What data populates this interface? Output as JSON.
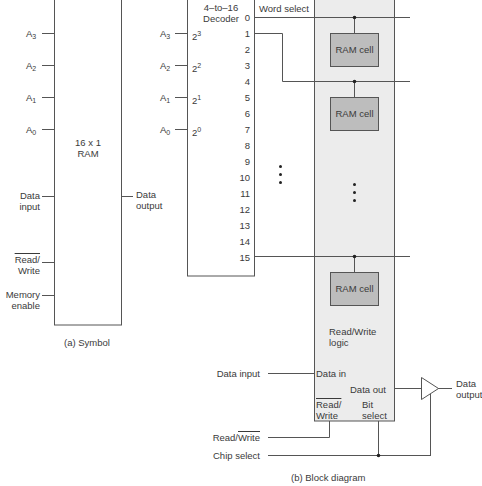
{
  "figure": {
    "symbol": {
      "caption": "(a) Symbol",
      "title_line1": "16 x 1",
      "title_line2": "RAM",
      "address_inputs": [
        {
          "base": "A",
          "sub": "3"
        },
        {
          "base": "A",
          "sub": "2"
        },
        {
          "base": "A",
          "sub": "1"
        },
        {
          "base": "A",
          "sub": "0"
        }
      ],
      "data_input_line1": "Data",
      "data_input_line2": "input",
      "data_output_line1": "Data",
      "data_output_line2": "output",
      "read_write_line1": "Read/",
      "read_write_line2": "Write",
      "memory_enable_line1": "Memory",
      "memory_enable_line2": "enable"
    },
    "block_diagram": {
      "caption": "(b) Block diagram",
      "decoder": {
        "title_line1": "4–to–16",
        "title_line2": "Decoder",
        "inputs": [
          {
            "label_base": "A",
            "label_sub": "3",
            "pin_base": "2",
            "pin_sup": "3"
          },
          {
            "label_base": "A",
            "label_sub": "2",
            "pin_base": "2",
            "pin_sup": "2"
          },
          {
            "label_base": "A",
            "label_sub": "1",
            "pin_base": "2",
            "pin_sup": "1"
          },
          {
            "label_base": "A",
            "label_sub": "0",
            "pin_base": "2",
            "pin_sup": "0"
          }
        ],
        "outputs": [
          "0",
          "1",
          "2",
          "3",
          "4",
          "5",
          "6",
          "7",
          "8",
          "9",
          "10",
          "11",
          "12",
          "13",
          "14",
          "15"
        ]
      },
      "word_select_label": "Word select",
      "ram_cells": [
        "RAM cell",
        "RAM cell",
        "RAM cell"
      ],
      "rw_logic_line1": "Read/Write",
      "rw_logic_line2": "logic",
      "data_in": "Data in",
      "data_out": "Data out",
      "panel_read_line1": "Read/",
      "panel_read_line2": "Write",
      "bit_select_line1": "Bit",
      "bit_select_line2": "select",
      "ext_data_input": "Data input",
      "ext_read": "Read/",
      "ext_write": "Write",
      "ext_chip_select": "Chip select",
      "ext_data_output_line1": "Data",
      "ext_data_output_line2": "output"
    },
    "colors": {
      "line": "#555555",
      "panel_fill": "#ececec",
      "cell_fill": "#bdbdbd"
    }
  }
}
